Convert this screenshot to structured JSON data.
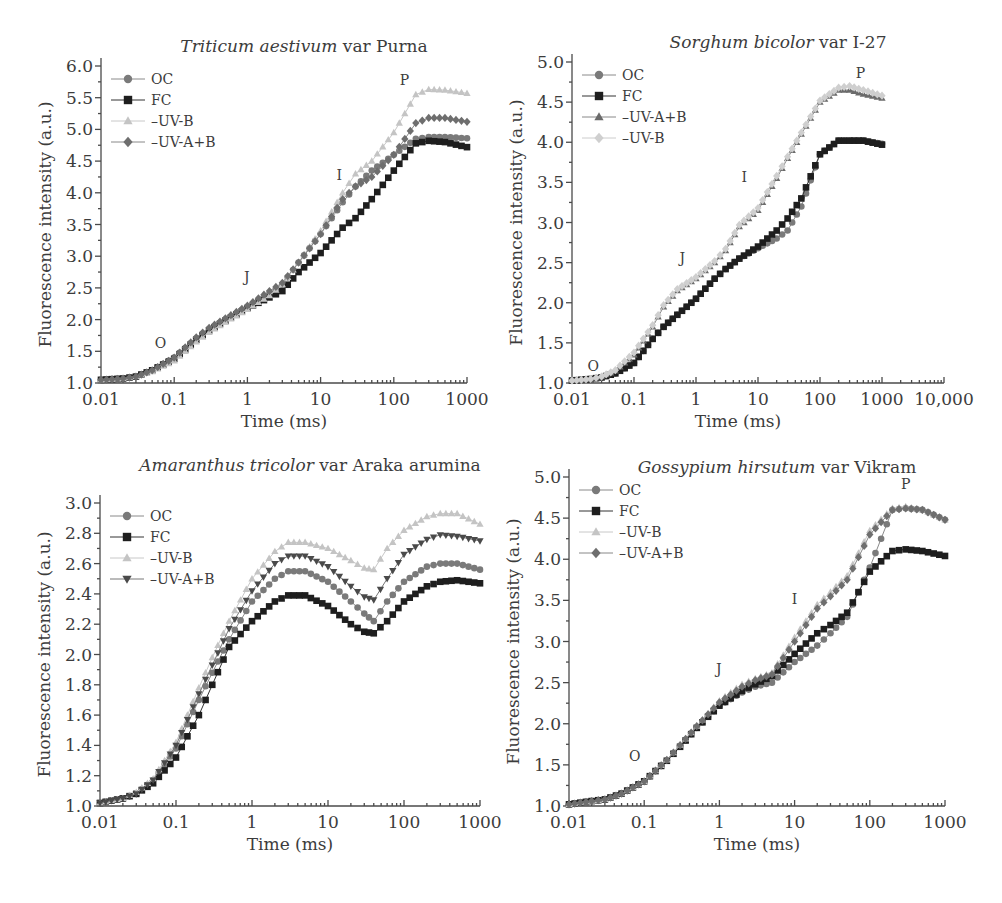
{
  "styles": {
    "OC": {
      "marker": "circle",
      "color": "#7a7a7a",
      "line": "#8a8a8a"
    },
    "FC": {
      "marker": "square",
      "color": "#1e1e1e",
      "line": "#333333"
    },
    "-UV-B": {
      "marker": "triangle",
      "color": "#c4c4c4",
      "line": "#c8c8c8"
    },
    "-UV-A+B": {
      "marker": "diamond",
      "color": "#6e6e6e",
      "line": "#888888"
    },
    "-UV-A+B_tri": {
      "marker": "triangle",
      "color": "#6a6a6a",
      "line": "#888888"
    },
    "-UV-B_dia": {
      "marker": "diamond",
      "color": "#cfcfcf",
      "line": "#cccccc"
    },
    "-UV-A+B_inv": {
      "marker": "triangle-down",
      "color": "#4a4a4a",
      "line": "#777777"
    }
  },
  "chart_data": [
    {
      "id": "triticum",
      "type": "scatter",
      "title_italic": "Triticum aestivum",
      "title_rest": " var Purna",
      "xlabel": "Time (ms)",
      "ylabel": "Fluorescence intensity (a.u.)",
      "xscale": "log",
      "xlim": [
        0.01,
        1000
      ],
      "ylim": [
        1.0,
        6.0
      ],
      "xticks": [
        0.01,
        0.1,
        1,
        10,
        100,
        1000
      ],
      "xtick_labels": [
        "0.01",
        "0.1",
        "1",
        "10",
        "100",
        "1000"
      ],
      "yticks": [
        1.0,
        1.5,
        2.0,
        2.5,
        3.0,
        3.5,
        4.0,
        4.5,
        5.0,
        5.5,
        6.0
      ],
      "ytick_labels": [
        "1.0",
        "1.5",
        "2.0",
        "2.5",
        "3.0",
        "3.5",
        "4.0",
        "4.5",
        "5.0",
        "5.5",
        "6.0"
      ],
      "legend_position": "upper left",
      "phase_labels": [
        {
          "text": "O",
          "x": 0.065,
          "y": 1.55
        },
        {
          "text": "J",
          "x": 0.98,
          "y": 2.6
        },
        {
          "text": "I",
          "x": 18,
          "y": 4.2
        },
        {
          "text": "P",
          "x": 140,
          "y": 5.7
        }
      ],
      "x": [
        0.01,
        0.02,
        0.03,
        0.05,
        0.1,
        0.2,
        0.3,
        0.5,
        1,
        2,
        3,
        5,
        10,
        20,
        30,
        50,
        100,
        200,
        300,
        500,
        1000
      ],
      "series": [
        {
          "name": "OC",
          "style": "OC",
          "values": [
            1.05,
            1.07,
            1.1,
            1.2,
            1.4,
            1.7,
            1.85,
            2.0,
            2.2,
            2.4,
            2.55,
            2.9,
            3.35,
            3.85,
            4.1,
            4.35,
            4.6,
            4.85,
            4.88,
            4.88,
            4.86
          ]
        },
        {
          "name": "FC",
          "style": "FC",
          "values": [
            1.05,
            1.07,
            1.1,
            1.2,
            1.38,
            1.68,
            1.83,
            1.98,
            2.18,
            2.35,
            2.45,
            2.75,
            3.05,
            3.45,
            3.6,
            3.9,
            4.35,
            4.78,
            4.82,
            4.8,
            4.72
          ]
        },
        {
          "name": "-UV-B",
          "style": "-UV-B",
          "values": [
            1.05,
            1.07,
            1.1,
            1.18,
            1.35,
            1.65,
            1.8,
            1.96,
            2.16,
            2.38,
            2.55,
            2.9,
            3.4,
            4.0,
            4.3,
            4.5,
            4.95,
            5.55,
            5.63,
            5.62,
            5.57
          ]
        },
        {
          "name": "-UV-A+B",
          "style": "-UV-A+B",
          "values": [
            1.05,
            1.07,
            1.1,
            1.2,
            1.4,
            1.72,
            1.87,
            2.02,
            2.22,
            2.45,
            2.58,
            2.9,
            3.35,
            3.9,
            4.1,
            4.25,
            4.6,
            5.1,
            5.18,
            5.18,
            5.12
          ]
        }
      ],
      "frame": {
        "left": 101,
        "top": 66,
        "right": 467,
        "bottom": 383
      }
    },
    {
      "id": "sorghum",
      "type": "scatter",
      "title_italic": "Sorghum bicolor",
      "title_rest": " var I-27",
      "xlabel": "Time (ms)",
      "ylabel": "Fluorescence intensity (a.u.)",
      "xscale": "log",
      "xlim": [
        0.01,
        10000
      ],
      "ylim": [
        1.0,
        5.0
      ],
      "xticks": [
        0.01,
        0.1,
        1,
        10,
        100,
        1000,
        10000
      ],
      "xtick_labels": [
        "0.01",
        "0.1",
        "1",
        "10",
        "100",
        "1000",
        "10,000"
      ],
      "yticks": [
        1.0,
        1.5,
        2.0,
        2.5,
        3.0,
        3.5,
        4.0,
        4.5,
        5.0
      ],
      "ytick_labels": [
        "1.0",
        "1.5",
        "2.0",
        "2.5",
        "3.0",
        "3.5",
        "4.0",
        "4.5",
        "5.0"
      ],
      "legend_position": "upper left",
      "phase_labels": [
        {
          "text": "O",
          "x": 0.022,
          "y": 1.15
        },
        {
          "text": "J",
          "x": 0.6,
          "y": 2.5
        },
        {
          "text": "I",
          "x": 6,
          "y": 3.5
        },
        {
          "text": "P",
          "x": 450,
          "y": 4.8
        }
      ],
      "x": [
        0.01,
        0.02,
        0.03,
        0.05,
        0.1,
        0.2,
        0.3,
        0.5,
        1,
        2,
        3,
        5,
        10,
        20,
        30,
        50,
        100,
        200,
        300,
        500,
        1000
      ],
      "series": [
        {
          "name": "OC",
          "style": "OC",
          "values": [
            1.03,
            1.05,
            1.07,
            1.12,
            1.25,
            1.55,
            1.7,
            1.85,
            2.05,
            2.3,
            2.42,
            2.55,
            2.68,
            2.8,
            2.9,
            3.2,
            3.85,
            4.02,
            4.02,
            4.02,
            3.98
          ]
        },
        {
          "name": "FC",
          "style": "FC",
          "values": [
            1.03,
            1.05,
            1.07,
            1.12,
            1.25,
            1.55,
            1.7,
            1.85,
            2.05,
            2.3,
            2.42,
            2.55,
            2.7,
            2.9,
            3.05,
            3.3,
            3.85,
            4.02,
            4.02,
            4.02,
            3.97
          ]
        },
        {
          "name": "-UV-A+B",
          "style": "-UV-A+B_tri",
          "values": [
            1.03,
            1.05,
            1.08,
            1.15,
            1.35,
            1.7,
            1.95,
            2.15,
            2.3,
            2.5,
            2.65,
            2.95,
            3.15,
            3.55,
            3.8,
            4.1,
            4.5,
            4.65,
            4.65,
            4.6,
            4.55
          ]
        },
        {
          "name": "-UV-B",
          "style": "-UV-B_dia",
          "values": [
            1.03,
            1.05,
            1.08,
            1.16,
            1.38,
            1.72,
            1.97,
            2.17,
            2.32,
            2.52,
            2.67,
            2.97,
            3.18,
            3.58,
            3.82,
            4.12,
            4.52,
            4.68,
            4.7,
            4.65,
            4.58
          ]
        }
      ],
      "frame": {
        "left": 572,
        "top": 62,
        "right": 944,
        "bottom": 383
      }
    },
    {
      "id": "amaranthus",
      "type": "scatter",
      "title_italic": "Amaranthus tricolor",
      "title_rest": " var Araka arumina",
      "xlabel": "Time (ms)",
      "ylabel": "Fluorescence intensity (a.u.)",
      "xscale": "log",
      "xlim": [
        0.01,
        1000
      ],
      "ylim": [
        1.0,
        3.0
      ],
      "xticks": [
        0.01,
        0.1,
        1,
        10,
        100,
        1000
      ],
      "xtick_labels": [
        "0.01",
        "0.1",
        "1",
        "10",
        "100",
        "1000"
      ],
      "yticks": [
        1.0,
        1.2,
        1.4,
        1.6,
        1.8,
        2.0,
        2.2,
        2.4,
        2.6,
        2.8,
        3.0
      ],
      "ytick_labels": [
        "1.0",
        "1.2",
        "1.4",
        "1.6",
        "1.8",
        "2.0",
        "2.2",
        "2.4",
        "2.6",
        "2.8",
        "3.0"
      ],
      "legend_position": "upper left",
      "phase_labels": [],
      "x": [
        0.01,
        0.02,
        0.03,
        0.05,
        0.1,
        0.2,
        0.3,
        0.5,
        1,
        2,
        3,
        5,
        10,
        20,
        30,
        40,
        60,
        100,
        200,
        300,
        500,
        1000
      ],
      "series": [
        {
          "name": "OC",
          "style": "OC",
          "values": [
            1.02,
            1.05,
            1.08,
            1.17,
            1.38,
            1.7,
            1.88,
            2.1,
            2.35,
            2.5,
            2.55,
            2.55,
            2.48,
            2.35,
            2.27,
            2.22,
            2.35,
            2.48,
            2.58,
            2.6,
            2.6,
            2.56
          ]
        },
        {
          "name": "FC",
          "style": "FC",
          "values": [
            1.02,
            1.05,
            1.08,
            1.15,
            1.32,
            1.6,
            1.8,
            2.05,
            2.22,
            2.35,
            2.39,
            2.39,
            2.32,
            2.2,
            2.15,
            2.14,
            2.22,
            2.35,
            2.45,
            2.48,
            2.49,
            2.47
          ]
        },
        {
          "name": "-UV-B",
          "style": "-UV-B",
          "values": [
            1.02,
            1.05,
            1.09,
            1.18,
            1.42,
            1.78,
            1.98,
            2.22,
            2.5,
            2.68,
            2.74,
            2.74,
            2.7,
            2.62,
            2.57,
            2.56,
            2.7,
            2.82,
            2.91,
            2.93,
            2.93,
            2.86
          ]
        },
        {
          "name": "-UV-A+B",
          "style": "-UV-A+B_inv",
          "values": [
            1.02,
            1.05,
            1.08,
            1.17,
            1.4,
            1.74,
            1.93,
            2.17,
            2.42,
            2.6,
            2.65,
            2.65,
            2.58,
            2.45,
            2.38,
            2.36,
            2.5,
            2.66,
            2.76,
            2.79,
            2.78,
            2.75
          ]
        }
      ],
      "frame": {
        "left": 100,
        "top": 503,
        "right": 480,
        "bottom": 806
      }
    },
    {
      "id": "gossypium",
      "type": "scatter",
      "title_italic": "Gossypium hirsutum",
      "title_rest": " var Vikram",
      "xlabel": "Time (ms)",
      "ylabel": "Fluorescence intensity (a.u.)",
      "xscale": "log",
      "xlim": [
        0.01,
        1000
      ],
      "ylim": [
        1.0,
        5.0
      ],
      "xticks": [
        0.01,
        0.1,
        1,
        10,
        100,
        1000
      ],
      "xtick_labels": [
        "0.01",
        "0.1",
        "1",
        "10",
        "100",
        "1000"
      ],
      "yticks": [
        1.0,
        1.5,
        2.0,
        2.5,
        3.0,
        3.5,
        4.0,
        4.5,
        5.0
      ],
      "ytick_labels": [
        "1.0",
        "1.5",
        "2.0",
        "2.5",
        "3.0",
        "3.5",
        "4.0",
        "4.5",
        "5.0"
      ],
      "legend_position": "upper left",
      "phase_labels": [
        {
          "text": "O",
          "x": 0.075,
          "y": 1.55
        },
        {
          "text": "J",
          "x": 0.98,
          "y": 2.6
        },
        {
          "text": "I",
          "x": 10,
          "y": 3.45
        },
        {
          "text": "P",
          "x": 300,
          "y": 4.85
        }
      ],
      "x": [
        0.01,
        0.02,
        0.03,
        0.05,
        0.1,
        0.2,
        0.3,
        0.5,
        1,
        2,
        3,
        5,
        10,
        20,
        30,
        50,
        100,
        200,
        300,
        500,
        1000
      ],
      "series": [
        {
          "name": "OC",
          "style": "OC",
          "values": [
            1.02,
            1.06,
            1.08,
            1.15,
            1.3,
            1.55,
            1.72,
            1.95,
            2.22,
            2.38,
            2.45,
            2.5,
            2.75,
            2.95,
            3.1,
            3.3,
            3.9,
            4.6,
            4.62,
            4.6,
            4.48
          ]
        },
        {
          "name": "FC",
          "style": "FC",
          "values": [
            1.02,
            1.06,
            1.08,
            1.15,
            1.3,
            1.55,
            1.72,
            1.95,
            2.22,
            2.4,
            2.48,
            2.58,
            2.85,
            3.1,
            3.2,
            3.35,
            3.85,
            4.1,
            4.12,
            4.1,
            4.04
          ]
        },
        {
          "name": "-UV-B",
          "style": "-UV-B",
          "values": [
            1.02,
            1.06,
            1.08,
            1.15,
            1.3,
            1.56,
            1.74,
            1.97,
            2.28,
            2.48,
            2.55,
            2.62,
            3.05,
            3.45,
            3.6,
            3.8,
            4.35,
            4.62,
            4.64,
            4.6,
            4.48
          ]
        },
        {
          "name": "-UV-A+B",
          "style": "-UV-A+B",
          "values": [
            1.02,
            1.06,
            1.08,
            1.15,
            1.3,
            1.56,
            1.74,
            1.97,
            2.26,
            2.45,
            2.53,
            2.6,
            3.0,
            3.4,
            3.55,
            3.75,
            4.3,
            4.6,
            4.62,
            4.6,
            4.48
          ]
        }
      ],
      "frame": {
        "left": 569,
        "top": 477,
        "right": 945,
        "bottom": 806
      }
    }
  ]
}
